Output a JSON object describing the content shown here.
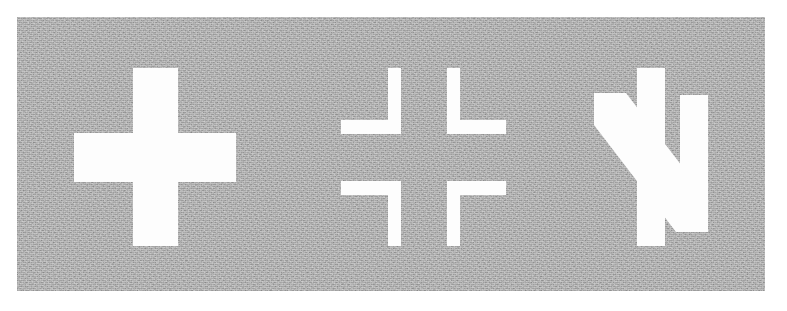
{
  "image": {
    "title": "Three white military aircraft insignia on a weathered gray panel",
    "canvas_width": 787,
    "canvas_height": 311,
    "page_background": "#ffffff"
  },
  "plate": {
    "name": "insignia-plate",
    "description": "Grainy light-gray rectangular background panel",
    "x": 17,
    "y": 17,
    "width": 748,
    "height": 274,
    "color": "#b0b0b0",
    "texture": "film-grain"
  },
  "marks": {
    "color": "#fdfdfd",
    "items": [
      {
        "id": "greek-cross",
        "label": "Greek cross",
        "description": "Solid white equal-armed plus cross",
        "x": 74,
        "y": 68,
        "width": 162,
        "height": 178,
        "arm_thickness": 48
      },
      {
        "id": "balkenkreuz",
        "label": "Balkenkreuz",
        "description": "Outline bar cross formed by four L-shaped corner elements",
        "x": 341,
        "y": 68,
        "width": 165,
        "height": 178,
        "bar_thickness": 14
      },
      {
        "id": "n-device",
        "label": "N device",
        "description": "Stylized letter N formed by two vertical bars and a thick diagonal stroke",
        "x": 594,
        "y": 68,
        "width": 116,
        "height": 178,
        "stroke_thickness": 30
      }
    ]
  }
}
